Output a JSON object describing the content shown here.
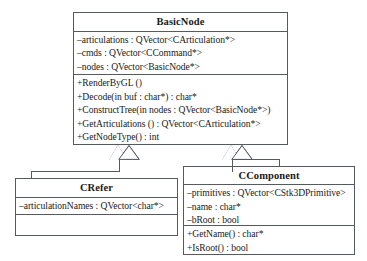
{
  "diagram": {
    "type": "uml-class-diagram",
    "title": "",
    "classes": [
      {
        "id": "basicnode",
        "name": "BasicNode",
        "attributes": [
          "–articulations : QVector<CArticulation*>",
          "–cmds : QVector<CCommand*>",
          "–nodes : QVector<BasicNode*>"
        ],
        "operations": [
          "+RenderByGL ()",
          "+Decode(in buf : char*) : char*",
          "+ConstructTree(in nodes : QVector<BasicNode*>)",
          "+GetArticulations () : QVector<CArticulation*>",
          "+GetNodeType() : int"
        ]
      },
      {
        "id": "crefer",
        "name": "CRefer",
        "attributes": [
          "–articulationNames : QVector<char*>"
        ],
        "operations": []
      },
      {
        "id": "ccomponent",
        "name": "CComponent",
        "attributes": [
          "–primitives : QVector<CStk3DPrimitive>",
          "–name : char*",
          "–bRoot : bool"
        ],
        "operations": [
          "+GetName() : char*",
          "+IsRoot() : bool"
        ]
      }
    ],
    "relationships": [
      {
        "id": "gen-crefer",
        "kind": "generalization",
        "from": "CRefer",
        "to": "BasicNode"
      },
      {
        "id": "gen-ccomponent",
        "kind": "generalization",
        "from": "CComponent",
        "to": "BasicNode"
      }
    ],
    "colors": {
      "stroke": "#555a5e",
      "background": "#ffffff",
      "text": "#1a1a1a"
    }
  }
}
